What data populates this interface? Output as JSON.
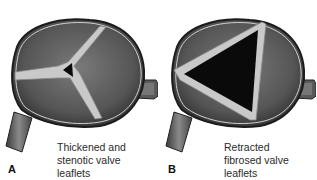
{
  "figure": {
    "panels": [
      {
        "label": "A",
        "caption_lines": [
          "Thickened and",
          "stenotic valve",
          "leaflets"
        ],
        "opening": "small"
      },
      {
        "label": "B",
        "caption_lines": [
          "Retracted",
          "fibrosed valve",
          "leaflets"
        ],
        "opening": "large"
      }
    ]
  },
  "colors": {
    "background": "#ffffff",
    "chamber_dark": "#3c3c3c",
    "chamber_mid": "#6a6a6a",
    "leaflet_light": "#c9c9c9",
    "opening": "#0a0a0a",
    "text": "#2a2a2a"
  }
}
